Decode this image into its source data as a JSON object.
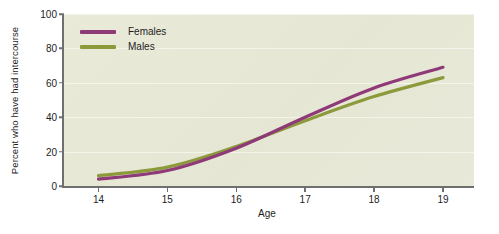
{
  "chart_data": {
    "type": "line",
    "title": "",
    "xlabel": "Age",
    "ylabel": "Percent who have had intercourse",
    "x": [
      14,
      15,
      16,
      17,
      18,
      19
    ],
    "xtick_labels": [
      "14",
      "15",
      "16",
      "17",
      "18",
      "19"
    ],
    "ytick_labels": [
      "0",
      "20",
      "40",
      "60",
      "80",
      "100"
    ],
    "yticks": [
      0,
      20,
      40,
      60,
      80,
      100
    ],
    "xlim": [
      13.5,
      19.45
    ],
    "ylim": [
      0,
      100
    ],
    "grid": "horizontal",
    "legend_position": "top-left",
    "series": [
      {
        "name": "Females",
        "color": "#8e3a78",
        "values": [
          4,
          9,
          22,
          40,
          57,
          69
        ]
      },
      {
        "name": "Males",
        "color": "#8c9a3c",
        "values": [
          6,
          11,
          23,
          38,
          52,
          63
        ]
      }
    ]
  },
  "plot": {
    "background_color": "#e9e9d9",
    "axis_color": "#6f6f6f",
    "gridline_color": "#f4f4ea"
  },
  "legend": {
    "entries": [
      {
        "label": "Females",
        "color": "#8e3a78"
      },
      {
        "label": "Males",
        "color": "#8c9a3c"
      }
    ]
  }
}
